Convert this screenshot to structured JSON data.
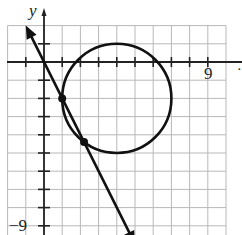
{
  "chart_data": {
    "type": "line",
    "title": "",
    "xlabel": "x",
    "ylabel": "y",
    "xlim": [
      -2,
      10
    ],
    "ylim": [
      -9.5,
      2
    ],
    "grid": true,
    "tick_labels": {
      "x": [
        "9"
      ],
      "y": [
        "-9"
      ]
    },
    "series": [
      {
        "name": "line",
        "kind": "line",
        "equation": "y = -2x",
        "x": [
          -1,
          5
        ],
        "y": [
          2,
          -10
        ],
        "arrows": "both"
      },
      {
        "name": "circle",
        "kind": "circle",
        "equation": "(x-4)^2 + (y+2)^2 = 9",
        "center": [
          4,
          -2
        ],
        "radius": 3
      }
    ],
    "points": [
      {
        "x": 1,
        "y": -2
      },
      {
        "x": 2.2,
        "y": -4.4
      }
    ]
  },
  "labels": {
    "y_axis": "y",
    "x_tick_9": "9",
    "y_tick_neg9": "−9",
    "x_axis_partial": "·"
  }
}
